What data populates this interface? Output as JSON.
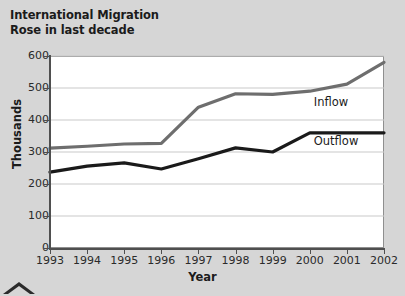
{
  "title": {
    "line1": "International Migration",
    "line2": "Rose in last decade"
  },
  "icons": {
    "caret": "caret-up-icon"
  },
  "colors": {
    "background": "#d6d6d6",
    "plot_background": "#ffffff",
    "axis": "#4f4f4f",
    "grid": "#c9c9c9",
    "inflow": "#6e6e6e",
    "outflow": "#1a1a1a",
    "text": "#1b1b1b"
  },
  "chart_data": {
    "type": "line",
    "title": "International Migration Rose in last decade",
    "xlabel": "Year",
    "ylabel": "Thousands",
    "x": [
      1993,
      1994,
      1995,
      1996,
      1997,
      1998,
      1999,
      2000,
      2001,
      2002
    ],
    "xtick_labels": [
      "1993",
      "1994",
      "1995",
      "1996",
      "1997",
      "1998",
      "1999",
      "2000",
      "2001",
      "2002"
    ],
    "ytick_labels": [
      "0",
      "100",
      "200",
      "300",
      "400",
      "500",
      "600"
    ],
    "yticks": [
      0,
      100,
      200,
      300,
      400,
      500,
      600
    ],
    "ylim": [
      0,
      600
    ],
    "grid": true,
    "legend": "inline-labels",
    "series": [
      {
        "name": "Inflow",
        "color": "#6e6e6e",
        "values": [
          312,
          318,
          325,
          327,
          440,
          482,
          480,
          490,
          512,
          580
        ]
      },
      {
        "name": "Outflow",
        "color": "#1a1a1a",
        "values": [
          237,
          256,
          266,
          247,
          279,
          313,
          300,
          360,
          360,
          360
        ]
      }
    ],
    "annotations": [
      {
        "text": "Inflow",
        "x": 2000,
        "y": 452
      },
      {
        "text": "Outflow",
        "x": 2000,
        "y": 330
      }
    ]
  }
}
